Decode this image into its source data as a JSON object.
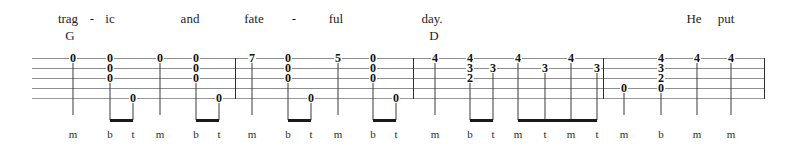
{
  "document": {
    "kind": "tablature-line",
    "instrument_strings": 5,
    "width": 795,
    "height": 150
  },
  "lyrics": [
    {
      "text": "trag",
      "x": 68
    },
    {
      "text": "-",
      "x": 92
    },
    {
      "text": "ic",
      "x": 110
    },
    {
      "text": "and",
      "x": 190
    },
    {
      "text": "fate",
      "x": 254
    },
    {
      "text": "-",
      "x": 294
    },
    {
      "text": "ful",
      "x": 336
    },
    {
      "text": "day.",
      "x": 432
    },
    {
      "text": "He",
      "x": 694
    },
    {
      "text": "put",
      "x": 726
    }
  ],
  "chords": [
    {
      "name": "G",
      "x": 70
    },
    {
      "name": "D",
      "x": 434
    }
  ],
  "staff": {
    "left": 32,
    "right": 765,
    "line_count": 5,
    "barlines": [
      235,
      413,
      603,
      764
    ]
  },
  "notes": [
    {
      "x": 73,
      "frets": [
        {
          "string": 1,
          "fret": "0"
        }
      ],
      "stem": "long",
      "finger": "m"
    },
    {
      "x": 110,
      "frets": [
        {
          "string": 1,
          "fret": "0"
        },
        {
          "string": 2,
          "fret": "0"
        },
        {
          "string": 3,
          "fret": "0"
        }
      ],
      "stem": "beam",
      "finger": "b"
    },
    {
      "x": 133,
      "frets": [
        {
          "string": 5,
          "fret": "0"
        }
      ],
      "stem": "beam",
      "finger": "t"
    },
    {
      "x": 160,
      "frets": [
        {
          "string": 1,
          "fret": "0"
        }
      ],
      "stem": "long",
      "finger": "m"
    },
    {
      "x": 196,
      "frets": [
        {
          "string": 1,
          "fret": "0"
        },
        {
          "string": 2,
          "fret": "0"
        },
        {
          "string": 3,
          "fret": "0"
        }
      ],
      "stem": "beam",
      "finger": "b"
    },
    {
      "x": 219,
      "frets": [
        {
          "string": 5,
          "fret": "0"
        }
      ],
      "stem": "beam",
      "finger": "t"
    },
    {
      "x": 252,
      "frets": [
        {
          "string": 1,
          "fret": "7"
        }
      ],
      "stem": "long",
      "finger": "m"
    },
    {
      "x": 288,
      "frets": [
        {
          "string": 1,
          "fret": "0"
        },
        {
          "string": 2,
          "fret": "0"
        },
        {
          "string": 3,
          "fret": "0"
        }
      ],
      "stem": "beam",
      "finger": "b"
    },
    {
      "x": 311,
      "frets": [
        {
          "string": 5,
          "fret": "0"
        }
      ],
      "stem": "beam",
      "finger": "t"
    },
    {
      "x": 338,
      "frets": [
        {
          "string": 1,
          "fret": "5"
        }
      ],
      "stem": "long",
      "finger": "m"
    },
    {
      "x": 373,
      "frets": [
        {
          "string": 1,
          "fret": "0"
        },
        {
          "string": 2,
          "fret": "0"
        },
        {
          "string": 3,
          "fret": "0"
        }
      ],
      "stem": "beam",
      "finger": "b"
    },
    {
      "x": 396,
      "frets": [
        {
          "string": 5,
          "fret": "0"
        }
      ],
      "stem": "beam",
      "finger": "t"
    },
    {
      "x": 435,
      "frets": [
        {
          "string": 1,
          "fret": "4"
        }
      ],
      "stem": "long",
      "finger": "m"
    },
    {
      "x": 470,
      "frets": [
        {
          "string": 1,
          "fret": "4"
        },
        {
          "string": 2,
          "fret": "3"
        },
        {
          "string": 3,
          "fret": "2"
        }
      ],
      "stem": "beam",
      "finger": "b"
    },
    {
      "x": 493,
      "frets": [
        {
          "string": 2,
          "fret": "3"
        }
      ],
      "stem": "beam",
      "finger": "t"
    },
    {
      "x": 518,
      "frets": [
        {
          "string": 1,
          "fret": "4"
        }
      ],
      "stem": "beam",
      "finger": "m"
    },
    {
      "x": 545,
      "frets": [
        {
          "string": 2,
          "fret": "3"
        }
      ],
      "stem": "beam",
      "finger": "t"
    },
    {
      "x": 571,
      "frets": [
        {
          "string": 1,
          "fret": "4"
        }
      ],
      "stem": "beam",
      "finger": "m"
    },
    {
      "x": 597,
      "frets": [
        {
          "string": 2,
          "fret": "3"
        }
      ],
      "stem": "beam",
      "finger": "t"
    },
    {
      "x": 624,
      "frets": [
        {
          "string": 4,
          "fret": "0"
        }
      ],
      "stem": "long",
      "finger": "m"
    },
    {
      "x": 661,
      "frets": [
        {
          "string": 1,
          "fret": "4"
        },
        {
          "string": 2,
          "fret": "3"
        },
        {
          "string": 3,
          "fret": "2"
        },
        {
          "string": 4,
          "fret": "0"
        }
      ],
      "stem": "long",
      "finger": "b"
    },
    {
      "x": 697,
      "frets": [
        {
          "string": 1,
          "fret": "4"
        }
      ],
      "stem": "long",
      "finger": "m"
    },
    {
      "x": 731,
      "frets": [
        {
          "string": 1,
          "fret": "4"
        }
      ],
      "stem": "long",
      "finger": "m"
    }
  ],
  "beams": [
    {
      "from": 110,
      "to": 133
    },
    {
      "from": 196,
      "to": 219
    },
    {
      "from": 288,
      "to": 311
    },
    {
      "from": 373,
      "to": 396
    },
    {
      "from": 470,
      "to": 493
    },
    {
      "from": 518,
      "to": 597
    }
  ],
  "fingerings": [
    {
      "label": "m",
      "x": 73
    },
    {
      "label": "b",
      "x": 110
    },
    {
      "label": "t",
      "x": 133
    },
    {
      "label": "m",
      "x": 160
    },
    {
      "label": "b",
      "x": 196
    },
    {
      "label": "t",
      "x": 219
    },
    {
      "label": "m",
      "x": 252
    },
    {
      "label": "b",
      "x": 288
    },
    {
      "label": "t",
      "x": 311
    },
    {
      "label": "m",
      "x": 338
    },
    {
      "label": "b",
      "x": 373
    },
    {
      "label": "t",
      "x": 396
    },
    {
      "label": "m",
      "x": 435
    },
    {
      "label": "b",
      "x": 470
    },
    {
      "label": "t",
      "x": 493
    },
    {
      "label": "m",
      "x": 518
    },
    {
      "label": "t",
      "x": 545
    },
    {
      "label": "m",
      "x": 571
    },
    {
      "label": "t",
      "x": 597
    },
    {
      "label": "m",
      "x": 624
    },
    {
      "label": "b",
      "x": 661
    },
    {
      "label": "m",
      "x": 697
    },
    {
      "label": "m",
      "x": 731
    }
  ]
}
